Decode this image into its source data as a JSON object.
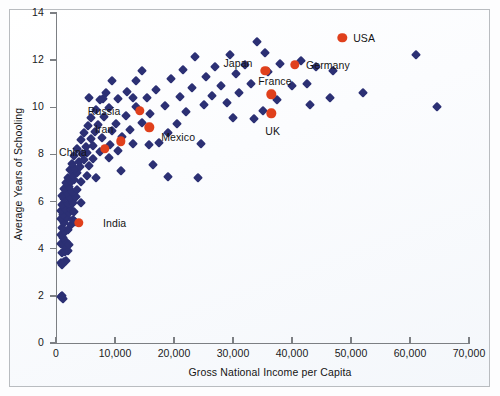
{
  "figure": {
    "background_color": "#fdfdfe",
    "border_color": "#b9bcc0",
    "axis_color": "#7c7f83"
  },
  "chart_data": {
    "type": "scatter",
    "title": "",
    "xlabel": "Gross National Income per Capita",
    "ylabel": "Average Years of Schooling",
    "xlim": [
      0,
      70000
    ],
    "ylim": [
      0,
      14
    ],
    "xticks": [
      0,
      10000,
      20000,
      30000,
      40000,
      50000,
      60000,
      70000
    ],
    "xticklabels": [
      "0",
      "10,000",
      "20,000",
      "30,000",
      "40,000",
      "50,000",
      "60,000",
      "70,000"
    ],
    "yticks": [
      0,
      2,
      4,
      6,
      8,
      10,
      12,
      14
    ],
    "yticklabels": [
      "0",
      "2",
      "4",
      "6",
      "8",
      "10",
      "12",
      "14"
    ],
    "grid": false,
    "legend": null,
    "series": [
      {
        "name": "Countries",
        "marker": "diamond",
        "color": "#2c3074",
        "points": [
          [
            1000,
            2.0
          ],
          [
            1200,
            1.85
          ],
          [
            900,
            1.95
          ],
          [
            900,
            3.4
          ],
          [
            1300,
            3.45
          ],
          [
            1700,
            3.5
          ],
          [
            1100,
            3.3
          ],
          [
            1000,
            3.8
          ],
          [
            1500,
            3.85
          ],
          [
            2000,
            3.9
          ],
          [
            1300,
            4.1
          ],
          [
            900,
            4.2
          ],
          [
            1700,
            4.3
          ],
          [
            2200,
            4.15
          ],
          [
            1200,
            4.45
          ],
          [
            800,
            4.6
          ],
          [
            1500,
            4.7
          ],
          [
            2000,
            4.8
          ],
          [
            1000,
            4.9
          ],
          [
            2500,
            5.0
          ],
          [
            1400,
            5.1
          ],
          [
            900,
            5.25
          ],
          [
            1900,
            5.3
          ],
          [
            2800,
            5.2
          ],
          [
            3300,
            5.15
          ],
          [
            1200,
            5.45
          ],
          [
            2200,
            5.5
          ],
          [
            800,
            5.6
          ],
          [
            1600,
            5.7
          ],
          [
            2600,
            5.65
          ],
          [
            3100,
            5.55
          ],
          [
            1100,
            5.85
          ],
          [
            2000,
            5.9
          ],
          [
            2900,
            5.95
          ],
          [
            4200,
            5.95
          ],
          [
            1400,
            6.1
          ],
          [
            2400,
            6.15
          ],
          [
            3400,
            6.2
          ],
          [
            1000,
            6.25
          ],
          [
            1900,
            6.35
          ],
          [
            2700,
            6.4
          ],
          [
            1300,
            6.55
          ],
          [
            2200,
            6.6
          ],
          [
            3600,
            6.5
          ],
          [
            1700,
            6.8
          ],
          [
            2500,
            6.85
          ],
          [
            3000,
            6.9
          ],
          [
            4300,
            6.85
          ],
          [
            2000,
            7.0
          ],
          [
            2800,
            7.1
          ],
          [
            3500,
            7.2
          ],
          [
            5200,
            7.1
          ],
          [
            6800,
            7.0
          ],
          [
            2400,
            7.35
          ],
          [
            3200,
            7.4
          ],
          [
            4100,
            7.45
          ],
          [
            5600,
            7.5
          ],
          [
            2700,
            7.6
          ],
          [
            3900,
            7.7
          ],
          [
            4800,
            7.75
          ],
          [
            6200,
            7.8
          ],
          [
            8900,
            7.85
          ],
          [
            3100,
            7.95
          ],
          [
            4400,
            8.0
          ],
          [
            5300,
            8.05
          ],
          [
            7400,
            8.1
          ],
          [
            10500,
            8.15
          ],
          [
            3600,
            8.25
          ],
          [
            5000,
            8.3
          ],
          [
            6300,
            8.35
          ],
          [
            9200,
            8.4
          ],
          [
            13000,
            8.45
          ],
          [
            15800,
            8.4
          ],
          [
            4200,
            8.6
          ],
          [
            5900,
            8.65
          ],
          [
            7800,
            8.7
          ],
          [
            11200,
            8.75
          ],
          [
            17500,
            8.5
          ],
          [
            4800,
            8.9
          ],
          [
            6600,
            8.95
          ],
          [
            9500,
            9.0
          ],
          [
            12500,
            9.05
          ],
          [
            19000,
            8.9
          ],
          [
            5400,
            9.2
          ],
          [
            7200,
            9.25
          ],
          [
            10200,
            9.3
          ],
          [
            14500,
            9.35
          ],
          [
            20500,
            9.3
          ],
          [
            24500,
            8.45
          ],
          [
            6000,
            9.55
          ],
          [
            8200,
            9.6
          ],
          [
            11800,
            9.65
          ],
          [
            16000,
            9.7
          ],
          [
            22000,
            9.8
          ],
          [
            30000,
            9.55
          ],
          [
            33500,
            9.5
          ],
          [
            6700,
            9.9
          ],
          [
            9000,
            9.95
          ],
          [
            13500,
            10.0
          ],
          [
            18500,
            10.05
          ],
          [
            25000,
            10.1
          ],
          [
            29000,
            10.2
          ],
          [
            35000,
            9.85
          ],
          [
            7500,
            10.3
          ],
          [
            10500,
            10.35
          ],
          [
            15500,
            10.4
          ],
          [
            21000,
            10.45
          ],
          [
            26500,
            10.5
          ],
          [
            31000,
            10.6
          ],
          [
            37500,
            10.3
          ],
          [
            43000,
            10.1
          ],
          [
            8500,
            10.6
          ],
          [
            12000,
            10.65
          ],
          [
            17000,
            10.75
          ],
          [
            23000,
            10.8
          ],
          [
            28000,
            10.9
          ],
          [
            33000,
            11.0
          ],
          [
            40000,
            10.9
          ],
          [
            46500,
            10.4
          ],
          [
            9500,
            11.1
          ],
          [
            13500,
            11.1
          ],
          [
            19500,
            11.2
          ],
          [
            25500,
            11.3
          ],
          [
            30500,
            11.4
          ],
          [
            36000,
            11.5
          ],
          [
            42500,
            11.0
          ],
          [
            52000,
            10.6
          ],
          [
            14500,
            11.55
          ],
          [
            21500,
            11.6
          ],
          [
            27000,
            11.7
          ],
          [
            32000,
            11.8
          ],
          [
            38000,
            11.85
          ],
          [
            41500,
            11.95
          ],
          [
            44000,
            11.7
          ],
          [
            64500,
            10.0
          ],
          [
            23500,
            12.15
          ],
          [
            29500,
            12.2
          ],
          [
            35500,
            12.3
          ],
          [
            47000,
            11.55
          ],
          [
            61000,
            12.2
          ],
          [
            34000,
            12.75
          ],
          [
            24000,
            7.0
          ],
          [
            19000,
            7.05
          ],
          [
            16500,
            7.55
          ],
          [
            11000,
            7.3
          ],
          [
            13000,
            10.4
          ],
          [
            8000,
            10.35
          ],
          [
            5600,
            10.4
          ]
        ]
      },
      {
        "name": "Highlighted countries",
        "marker": "circle",
        "color": "#e0401c",
        "points": [
          {
            "label": "India",
            "x": 3900,
            "y": 5.1,
            "label_dx": 24,
            "label_dy": 0
          },
          {
            "label": "China",
            "x": 8300,
            "y": 8.25,
            "label_dx": -46,
            "label_dy": 3
          },
          {
            "label": "Iran",
            "x": 11000,
            "y": 8.55,
            "label_dx": -26,
            "label_dy": -12
          },
          {
            "label": "Mexico",
            "x": 15800,
            "y": 9.15,
            "label_dx": 12,
            "label_dy": 10
          },
          {
            "label": "Russia",
            "x": 14200,
            "y": 9.85,
            "label_dx": -52,
            "label_dy": 0
          },
          {
            "label": "Japan",
            "x": 35500,
            "y": 11.55,
            "label_dx": -42,
            "label_dy": -8
          },
          {
            "label": "Germany",
            "x": 40500,
            "y": 11.8,
            "label_dx": 11,
            "label_dy": 0
          },
          {
            "label": "France",
            "x": 36500,
            "y": 10.55,
            "label_dx": -13,
            "label_dy": -13
          },
          {
            "label": "UK",
            "x": 36500,
            "y": 9.75,
            "label_dx": -6,
            "label_dy": 18
          },
          {
            "label": "USA",
            "x": 48500,
            "y": 12.95,
            "label_dx": 11,
            "label_dy": 0
          }
        ]
      }
    ]
  }
}
